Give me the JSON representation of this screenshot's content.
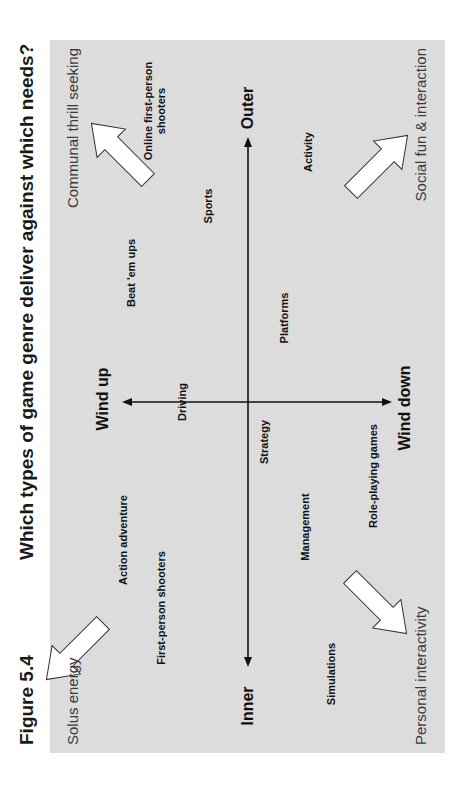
{
  "figure": {
    "label": "Figure 5.4",
    "title": "Which types of game genre deliver against which needs?"
  },
  "colors": {
    "panel_background": "#dcdcdc",
    "axis": "#111111",
    "arrow_fill": "#ffffff",
    "arrow_stroke": "#333333"
  },
  "axes": {
    "horizontal": {
      "left": "Inner",
      "right": "Outer"
    },
    "vertical": {
      "top": "Wind up",
      "bottom": "Wind down"
    }
  },
  "corners": {
    "top_left": "Solus energy",
    "top_right": "Communal thrill seeking",
    "bottom_left": "Personal interactivity",
    "bottom_right": "Social fun & interaction"
  },
  "genres": [
    {
      "label": "Online first-person",
      "label2": "shooters"
    },
    {
      "label": "Sports"
    },
    {
      "label": "Beat 'em ups"
    },
    {
      "label": "Activity"
    },
    {
      "label": "Platforms"
    },
    {
      "label": "Driving"
    },
    {
      "label": "Strategy"
    },
    {
      "label": "Action adventure"
    },
    {
      "label": "First-person shooters"
    },
    {
      "label": "Management"
    },
    {
      "label": "Role-playing games"
    },
    {
      "label": "Simulations"
    }
  ]
}
